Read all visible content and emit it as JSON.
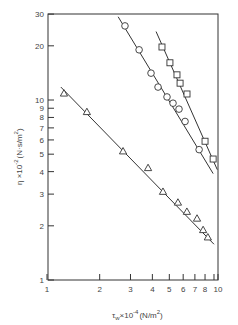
{
  "chart_data": {
    "type": "scatter",
    "title": "",
    "xlabel": "τw × 10⁻⁴ (N/m²)",
    "ylabel": "η × 10⁻² (N·s/m²)",
    "xscale": "log",
    "yscale": "log",
    "xlim": [
      1,
      10
    ],
    "ylim": [
      1,
      30
    ],
    "grid": false,
    "legend": null,
    "x_ticks": [
      1,
      2,
      3,
      4,
      5,
      6,
      7,
      8,
      9,
      10
    ],
    "x_tick_labels": [
      "1",
      "2",
      "3",
      "4",
      "5",
      "6",
      "7",
      "8",
      "",
      "10"
    ],
    "y_ticks": [
      1,
      2,
      3,
      4,
      5,
      6,
      7,
      8,
      9,
      10,
      20,
      30
    ],
    "y_tick_labels": [
      "1",
      "2",
      "3",
      "4",
      "5",
      "6",
      "7",
      "8",
      "9",
      "10",
      "20",
      "30"
    ],
    "series": [
      {
        "name": "triangles",
        "marker": "triangle",
        "x": [
          1.25,
          1.69,
          2.72,
          3.78,
          4.6,
          5.6,
          6.3,
          7.2,
          7.8,
          8.3
        ],
        "y": [
          10.9,
          8.6,
          5.2,
          4.2,
          3.1,
          2.7,
          2.4,
          2.2,
          1.9,
          1.73
        ],
        "fit_line": {
          "x": [
            1.2,
            9.0
          ],
          "y": [
            11.8,
            1.58
          ]
        }
      },
      {
        "name": "circles",
        "marker": "circle",
        "x": [
          2.79,
          3.36,
          3.93,
          4.31,
          4.85,
          5.25,
          5.68,
          6.15,
          7.4
        ],
        "y": [
          25.8,
          19.0,
          14.1,
          11.8,
          10.4,
          9.6,
          8.9,
          7.6,
          5.3
        ],
        "fit_line": {
          "x": [
            2.55,
            8.9
          ],
          "y": [
            29.0,
            3.9
          ]
        }
      },
      {
        "name": "squares",
        "marker": "square",
        "x": [
          4.54,
          5.04,
          5.53,
          5.76,
          6.31,
          8.0,
          8.9
        ],
        "y": [
          19.7,
          16.1,
          13.8,
          12.4,
          10.8,
          5.9,
          4.7
        ],
        "fit_line": {
          "x": [
            4.2,
            9.4
          ],
          "y": [
            24.0,
            4.1
          ]
        }
      }
    ]
  },
  "axes": {
    "xlabel_main": "τ",
    "xlabel_sub": "w",
    "xlabel_rest": "×10",
    "xlabel_exp": "-4",
    "xlabel_unit": "(N/m",
    "xlabel_unit_exp": "2",
    "xlabel_close": ")",
    "ylabel_main": "η ×10",
    "ylabel_exp": "-2",
    "ylabel_unit": "(N·s/m",
    "ylabel_unit_exp": "2",
    "ylabel_close": ")"
  }
}
